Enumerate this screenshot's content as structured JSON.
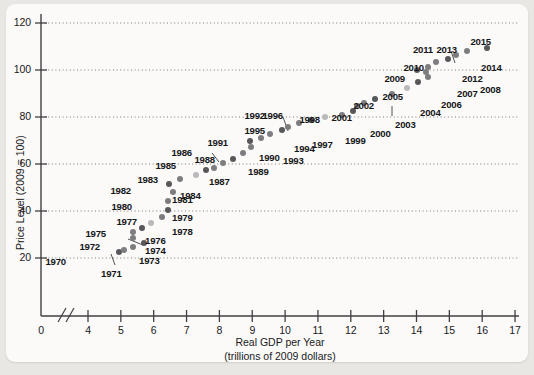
{
  "chart_data": {
    "type": "scatter",
    "title": "",
    "xlabel": "Real GDP per Year (trillions of 2009 dollars)",
    "xlabel_line1": "Real GDP per Year",
    "xlabel_line2": "(trillions of 2009 dollars)",
    "ylabel": "Price Level (2009 = 100)",
    "xlim": [
      3.5,
      17.4
    ],
    "ylim": [
      0,
      126
    ],
    "xticks": [
      0,
      4,
      5,
      6,
      7,
      8,
      9,
      10,
      11,
      12,
      13,
      14,
      15,
      16,
      17
    ],
    "xtick_labels": [
      "0",
      "4",
      "5",
      "6",
      "7",
      "8",
      "9",
      "10",
      "11",
      "12",
      "13",
      "14",
      "15",
      "16",
      "17"
    ],
    "yticks": [
      20,
      40,
      60,
      80,
      100,
      120
    ],
    "ytick_labels": [
      "20",
      "40",
      "60",
      "80",
      "100",
      "120"
    ],
    "grid": "horizontal-dotted",
    "axis_break": true,
    "legend": null,
    "marker_color": "#7d7d80",
    "points": [
      {
        "label": "1970",
        "x": 4.95,
        "y": 22.5,
        "lx": 66,
        "ly": 256,
        "anchor": "right",
        "leader": null
      },
      {
        "label": "1971",
        "x": 5.1,
        "y": 23.6,
        "lx": 101,
        "ly": 268,
        "anchor": "left",
        "leader": {
          "x1": 115,
          "y1": 265,
          "x2": 111,
          "y2": 254
        }
      },
      {
        "label": "1972",
        "x": 5.38,
        "y": 24.8,
        "lx": 100,
        "ly": 241,
        "anchor": "right",
        "leader": null
      },
      {
        "label": "1973",
        "x": 5.7,
        "y": 26.2,
        "lx": 139,
        "ly": 255,
        "anchor": "left",
        "leader": null
      },
      {
        "label": "1974",
        "x": 5.38,
        "y": 28.4,
        "lx": 145,
        "ly": 245,
        "anchor": "left",
        "leader": {
          "x1": 143,
          "y1": 245,
          "x2": 128,
          "y2": 239
        }
      },
      {
        "label": "1975",
        "x": 5.38,
        "y": 31.1,
        "lx": 106,
        "ly": 228,
        "anchor": "right",
        "leader": null
      },
      {
        "label": "1976",
        "x": 5.65,
        "y": 32.9,
        "lx": 145,
        "ly": 235,
        "anchor": "left",
        "leader": null
      },
      {
        "label": "1977",
        "x": 5.92,
        "y": 35.0,
        "lx": 137,
        "ly": 216,
        "anchor": "right",
        "leader": null
      },
      {
        "label": "1978",
        "x": 6.26,
        "y": 37.4,
        "lx": 172,
        "ly": 226,
        "anchor": "left",
        "leader": null
      },
      {
        "label": "1979",
        "x": 6.44,
        "y": 40.3,
        "lx": 172,
        "ly": 212,
        "anchor": "left",
        "leader": null
      },
      {
        "label": "1980",
        "x": 6.43,
        "y": 44.2,
        "lx": 132,
        "ly": 201,
        "anchor": "right",
        "leader": null
      },
      {
        "label": "1981",
        "x": 6.58,
        "y": 48.0,
        "lx": 172,
        "ly": 194,
        "anchor": "left",
        "leader": null
      },
      {
        "label": "1982",
        "x": 6.48,
        "y": 51.3,
        "lx": 131,
        "ly": 185,
        "anchor": "right",
        "leader": null
      },
      {
        "label": "1983",
        "x": 6.8,
        "y": 53.5,
        "lx": 158,
        "ly": 174,
        "anchor": "right",
        "leader": null
      },
      {
        "label": "1984",
        "x": 7.28,
        "y": 55.5,
        "lx": 180,
        "ly": 190,
        "anchor": "left",
        "leader": null
      },
      {
        "label": "1985",
        "x": 7.58,
        "y": 57.3,
        "lx": 176,
        "ly": 160,
        "anchor": "right",
        "leader": null
      },
      {
        "label": "1986",
        "x": 7.85,
        "y": 58.5,
        "lx": 192,
        "ly": 147,
        "anchor": "right",
        "leader": {
          "x1": 212,
          "y1": 153,
          "x2": 219,
          "y2": 162
        }
      },
      {
        "label": "1987",
        "x": 8.1,
        "y": 60.3,
        "lx": 209,
        "ly": 176,
        "anchor": "left",
        "leader": null
      },
      {
        "label": "1988",
        "x": 8.42,
        "y": 62.2,
        "lx": 215,
        "ly": 154,
        "anchor": "right",
        "leader": null
      },
      {
        "label": "1989",
        "x": 8.73,
        "y": 64.7,
        "lx": 248,
        "ly": 166,
        "anchor": "left",
        "leader": null
      },
      {
        "label": "1990",
        "x": 8.95,
        "y": 67.2,
        "lx": 259,
        "ly": 152,
        "anchor": "left",
        "leader": null
      },
      {
        "label": "1991",
        "x": 8.92,
        "y": 69.6,
        "lx": 228,
        "ly": 137,
        "anchor": "right",
        "leader": null
      },
      {
        "label": "1992",
        "x": 9.27,
        "y": 71.2,
        "lx": 265,
        "ly": 110,
        "anchor": "right",
        "leader": {
          "x1": 283,
          "y1": 117,
          "x2": 288,
          "y2": 131
        }
      },
      {
        "label": "1993",
        "x": 9.55,
        "y": 72.7,
        "lx": 283,
        "ly": 155,
        "anchor": "left",
        "leader": null
      },
      {
        "label": "1994",
        "x": 9.9,
        "y": 74.3,
        "lx": 294,
        "ly": 143,
        "anchor": "left",
        "leader": null
      },
      {
        "label": "1995",
        "x": 10.1,
        "y": 75.9,
        "lx": 265,
        "ly": 125,
        "anchor": "right",
        "leader": null
      },
      {
        "label": "1996",
        "x": 10.42,
        "y": 77.5,
        "lx": 283,
        "ly": 110,
        "anchor": "right",
        "leader": null
      },
      {
        "label": "1997",
        "x": 10.8,
        "y": 78.8,
        "lx": 312,
        "ly": 139,
        "anchor": "left",
        "leader": null
      },
      {
        "label": "1998",
        "x": 11.2,
        "y": 79.9,
        "lx": 320,
        "ly": 114,
        "anchor": "right",
        "leader": null
      },
      {
        "label": "1999",
        "x": 11.72,
        "y": 81.0,
        "lx": 345,
        "ly": 135,
        "anchor": "left",
        "leader": null
      },
      {
        "label": "2000",
        "x": 12.07,
        "y": 82.6,
        "lx": 370,
        "ly": 128,
        "anchor": "left",
        "leader": null
      },
      {
        "label": "2001",
        "x": 12.2,
        "y": 84.5,
        "lx": 352,
        "ly": 112,
        "anchor": "right",
        "leader": null
      },
      {
        "label": "2002",
        "x": 12.4,
        "y": 86.0,
        "lx": 374,
        "ly": 100,
        "anchor": "right",
        "leader": {
          "x1": 392,
          "y1": 106,
          "x2": 392,
          "y2": 116
        }
      },
      {
        "label": "2003",
        "x": 12.75,
        "y": 87.5,
        "lx": 395,
        "ly": 119,
        "anchor": "left",
        "leader": null
      },
      {
        "label": "2004",
        "x": 13.25,
        "y": 89.8,
        "lx": 420,
        "ly": 107,
        "anchor": "left",
        "leader": null
      },
      {
        "label": "2005",
        "x": 13.7,
        "y": 92.5,
        "lx": 403,
        "ly": 91,
        "anchor": "right",
        "leader": null
      },
      {
        "label": "2006",
        "x": 14.05,
        "y": 95.0,
        "lx": 441,
        "ly": 99,
        "anchor": "left",
        "leader": null
      },
      {
        "label": "2007",
        "x": 14.35,
        "y": 97.2,
        "lx": 457,
        "ly": 88,
        "anchor": "left",
        "leader": null
      },
      {
        "label": "2008",
        "x": 14.3,
        "y": 99.0,
        "lx": 480,
        "ly": 84,
        "anchor": "left",
        "leader": null
      },
      {
        "label": "2009",
        "x": 14.0,
        "y": 100.0,
        "lx": 405,
        "ly": 73,
        "anchor": "right",
        "leader": null
      },
      {
        "label": "2010",
        "x": 14.35,
        "y": 101.2,
        "lx": 424,
        "ly": 62,
        "anchor": "right",
        "leader": null
      },
      {
        "label": "2011",
        "x": 14.6,
        "y": 103.2,
        "lx": 433,
        "ly": 44,
        "anchor": "right",
        "leader": {
          "x1": 451,
          "y1": 51,
          "x2": 455,
          "y2": 63
        }
      },
      {
        "label": "2012",
        "x": 14.95,
        "y": 104.8,
        "lx": 462,
        "ly": 73,
        "anchor": "left",
        "leader": null
      },
      {
        "label": "2013",
        "x": 15.2,
        "y": 106.3,
        "lx": 457,
        "ly": 44,
        "anchor": "right",
        "leader": null
      },
      {
        "label": "2014",
        "x": 15.55,
        "y": 108.0,
        "lx": 481,
        "ly": 62,
        "anchor": "left",
        "leader": null
      },
      {
        "label": "2015",
        "x": 16.15,
        "y": 109.5,
        "lx": 491,
        "ly": 36,
        "anchor": "right",
        "leader": null
      }
    ]
  },
  "axes": {
    "y_title": "Price Level (2009 = 100)",
    "x_title_line1": "Real GDP per Year",
    "x_title_line2": "(trillions of 2009 dollars)"
  }
}
